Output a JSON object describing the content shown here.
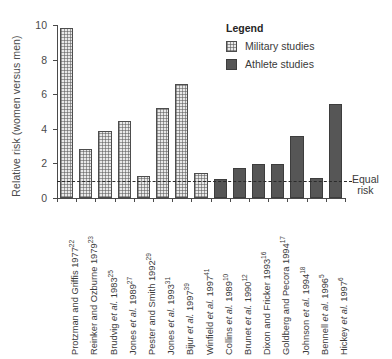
{
  "chart_data": {
    "type": "bar",
    "title": "",
    "xlabel": "",
    "ylabel": "Relative risk (women versus men)",
    "ylim": [
      0,
      10
    ],
    "yticks": [
      0,
      2,
      4,
      6,
      8,
      10
    ],
    "grid": false,
    "categories": [
      "Protzman and Griffis 1977",
      "Reinker and Ozburne 1979",
      "Brudvig et al. 1983",
      "Jones et al. 1989",
      "Pester and Smith 1992",
      "Jones et al. 1993",
      "Bijur et al. 1997",
      "Winfield et al. 1997",
      "Collins et al. 1989",
      "Brunet et al. 1990",
      "Dixon and Fricker 1993",
      "Goldberg and Pecora 1994",
      "Johnson et al. 1994",
      "Bennell et al. 1996",
      "Hickey et al. 1997"
    ],
    "category_refs": [
      "22",
      "23",
      "25",
      "27",
      "29",
      "31",
      "39",
      "41",
      "10",
      "12",
      "16",
      "17",
      "18",
      "5",
      "6"
    ],
    "values": [
      9.85,
      2.85,
      3.9,
      4.45,
      1.3,
      5.2,
      6.6,
      1.45,
      1.1,
      1.75,
      1.95,
      1.95,
      3.6,
      1.15,
      5.45
    ],
    "groups": [
      "Military studies",
      "Military studies",
      "Military studies",
      "Military studies",
      "Military studies",
      "Military studies",
      "Military studies",
      "Military studies",
      "Athlete studies",
      "Athlete studies",
      "Athlete studies",
      "Athlete studies",
      "Athlete studies",
      "Athlete studies",
      "Athlete studies"
    ],
    "reference_line": {
      "value": 1.0,
      "label": "Equal risk",
      "style": "dashed"
    },
    "legend": {
      "position": "top-right",
      "title": "Legend",
      "entries": [
        {
          "label": "Military studies",
          "pattern": "checkered-light",
          "color": "#e9e9e9"
        },
        {
          "label": "Athlete studies",
          "pattern": "solid",
          "color": "#565656"
        }
      ]
    }
  },
  "annotations": {
    "equal_risk_line1": "Equal",
    "equal_risk_line2": "risk"
  }
}
